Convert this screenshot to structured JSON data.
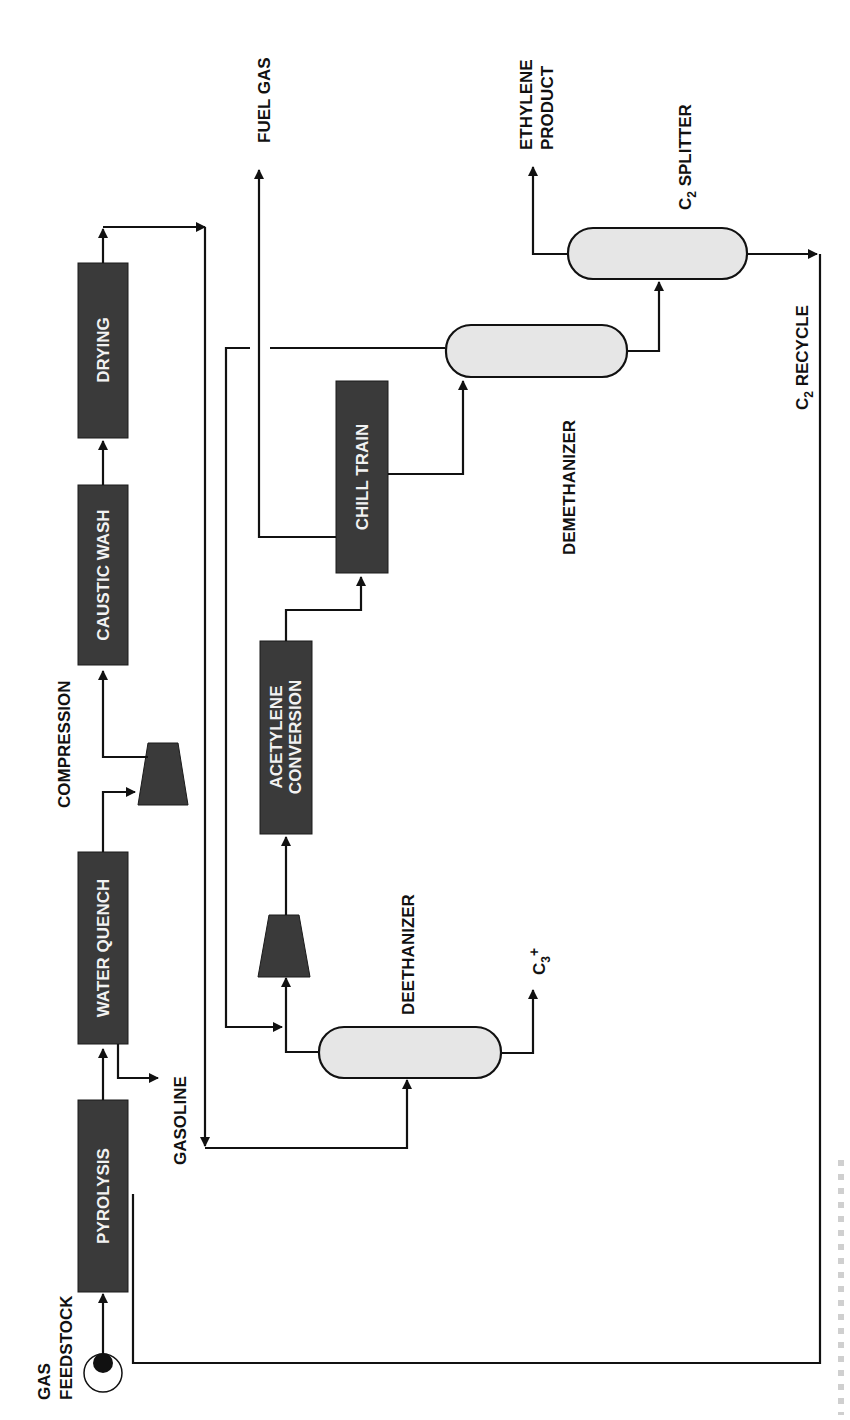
{
  "diagram": {
    "type": "process-flow",
    "orientation": "rotated-90-ccw",
    "colors": {
      "unit_fill": "#3a3a3a",
      "vessel_fill": "#e6e6e6",
      "line": "#111111",
      "background": "#ffffff"
    },
    "units": {
      "pyrolysis": "PYROLYSIS",
      "water_quench": "WATER QUENCH",
      "caustic_wash": "CAUSTIC WASH",
      "drying": "DRYING",
      "acetylene_conversion_line1": "ACETYLENE",
      "acetylene_conversion_line2": "CONVERSION",
      "chill_train": "CHILL TRAIN"
    },
    "labels": {
      "gas_feedstock_line1": "GAS",
      "gas_feedstock_line2": "FEEDSTOCK",
      "gasoline": "GASOLINE",
      "compression": "COMPRESSION",
      "fuel_gas": "FUEL GAS",
      "ethylene_product_line1": "ETHYLENE",
      "ethylene_product_line2": "PRODUCT",
      "c2_splitter_c": "C",
      "c2_splitter_sub": "2",
      "c2_splitter_rest": " SPLITTER",
      "demethanizer": "DEMETHANIZER",
      "deethanizer": "DEETHANIZER",
      "c3plus_c": "C",
      "c3plus_sub": "3",
      "c3plus_sup": "+",
      "c2_recycle_c": "C",
      "c2_recycle_sub": "2",
      "c2_recycle_rest": " RECYCLE"
    },
    "vessels": [
      "deethanizer",
      "demethanizer",
      "c2-splitter"
    ],
    "compressors": [
      "compression-1",
      "compression-2"
    ]
  }
}
